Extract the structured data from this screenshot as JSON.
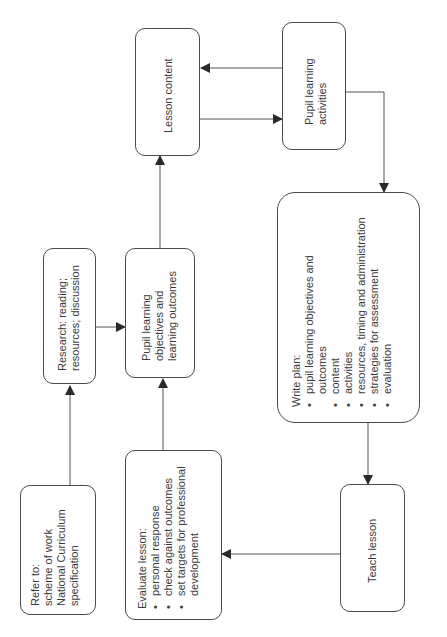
{
  "diagram": {
    "orientation": "rotated -90deg",
    "nodes": {
      "refer_to": {
        "title": "Refer to:",
        "lines": [
          "scheme of work",
          "National Curriculum",
          "specification"
        ]
      },
      "research": {
        "lines": [
          "Research: reading;",
          "resources; discussion"
        ]
      },
      "objectives": {
        "lines": [
          "Pupil learning",
          "objectives and",
          "learning outcomes"
        ]
      },
      "lesson_content": {
        "label": "Lesson content"
      },
      "activities": {
        "lines": [
          "Pupil learning",
          "activities"
        ]
      },
      "write_plan": {
        "title": "Write plan:",
        "items": [
          "pupil learning objectives and outcomes",
          "content",
          "activities",
          "resources, timing and administration",
          "strategies for assessment",
          "evaluation"
        ]
      },
      "teach_lesson": {
        "label": "Teach lesson"
      },
      "evaluate": {
        "title": "Evaluate lesson:",
        "items": [
          "personal response",
          "check against outcomes",
          "set targets for professional development"
        ]
      }
    },
    "edges": [
      {
        "from": "refer_to",
        "to": "research"
      },
      {
        "from": "research",
        "to": "objectives"
      },
      {
        "from": "evaluate",
        "to": "objectives"
      },
      {
        "from": "objectives",
        "to": "lesson_content"
      },
      {
        "from": "lesson_content",
        "to": "activities"
      },
      {
        "from": "activities",
        "to": "lesson_content"
      },
      {
        "from": "activities",
        "to": "write_plan"
      },
      {
        "from": "write_plan",
        "to": "teach_lesson"
      },
      {
        "from": "teach_lesson",
        "to": "evaluate"
      }
    ],
    "colors": {
      "stroke": "#4a4a4a",
      "text": "#3a3a3a",
      "background": "#ffffff"
    }
  }
}
